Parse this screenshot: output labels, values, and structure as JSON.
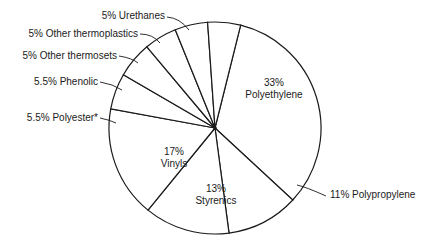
{
  "chart_data": {
    "type": "pie",
    "title": "",
    "start_angle_deg": -76,
    "direction": "clockwise",
    "center": [
      215,
      128
    ],
    "radius": 106,
    "slices": [
      {
        "name": "Polyethylene",
        "value": 33,
        "label": "33%",
        "sublabel": "Polyethylene",
        "label_pos": "inside"
      },
      {
        "name": "Polypropylene",
        "value": 11,
        "label": "11% Polypropylene",
        "label_pos": "outside"
      },
      {
        "name": "Styrenics",
        "value": 13,
        "label": "13%",
        "sublabel": "Styrenics",
        "label_pos": "inside"
      },
      {
        "name": "Vinyls",
        "value": 17,
        "label": "17%",
        "sublabel": "Vinyls",
        "label_pos": "inside"
      },
      {
        "name": "Polyester*",
        "value": 5.5,
        "label": "5.5% Polyester*",
        "label_pos": "outside"
      },
      {
        "name": "Phenolic",
        "value": 5.5,
        "label": "5.5% Phenolic",
        "label_pos": "outside"
      },
      {
        "name": "Other thermosets",
        "value": 5,
        "label": "5% Other thermosets",
        "label_pos": "outside"
      },
      {
        "name": "Other thermoplastics",
        "value": 5,
        "label": "5% Other thermoplastics",
        "label_pos": "outside"
      },
      {
        "name": "Urethanes",
        "value": 5,
        "label": "5% Urethanes",
        "label_pos": "outside"
      }
    ]
  },
  "style": {
    "line_color": "#1a1a1a",
    "fill_color": "#ffffff",
    "text_color": "#1a1a1a"
  }
}
